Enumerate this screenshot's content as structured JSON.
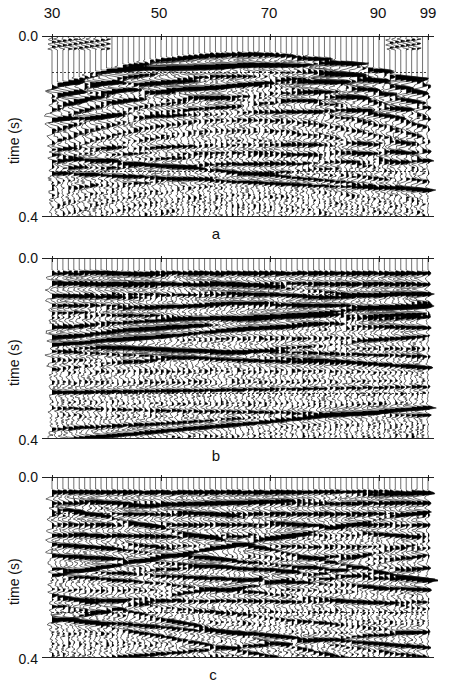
{
  "chart_data": [
    {
      "type": "seismic-wiggle",
      "title": "a",
      "xlabel": "trace number",
      "ylabel": "time (s)",
      "xticks": [
        30,
        50,
        70,
        90,
        99
      ],
      "yticks": [
        "0.0",
        "0.4"
      ],
      "xlim": [
        30,
        99
      ],
      "ylim": [
        0.0,
        0.4
      ],
      "description": "Raw shot gather with hyperbolic first-arrival reaching minimum (~0.04 s) near trace 65, deepening to ~0.1 s at edges; weak early noise at traces 30-40 and 92-97",
      "dashed_lines_at_s": [
        0.08,
        0.3
      ]
    },
    {
      "type": "seismic-wiggle",
      "title": "b",
      "xlabel": "trace number",
      "ylabel": "time (s)",
      "yticks": [
        "0.0",
        "0.4"
      ],
      "xlim": [
        30,
        99
      ],
      "ylim": [
        0.0,
        0.4
      ],
      "description": "Gather after flattening/static correction; first arrival flat near 0.03 s across all traces",
      "dashed_lines_at_s": [
        0.08,
        0.3
      ]
    },
    {
      "type": "seismic-wiggle",
      "title": "c",
      "xlabel": "trace number",
      "ylabel": "time (s)",
      "yticks": [
        "0.0",
        "0.4"
      ],
      "xlim": [
        30,
        99
      ],
      "ylim": [
        0.0,
        0.4
      ],
      "description": "Processed gather; flat first arrival near 0.03 s with dipping reflection events below 0.3 s",
      "dashed_lines_at_s": [
        0.08,
        0.3
      ]
    }
  ],
  "axis": {
    "xticks": [
      "30",
      "50",
      "70",
      "90",
      "99"
    ],
    "ylabel": "time (s)",
    "ytop": "0.0",
    "ybottom": "0.4"
  },
  "panels": [
    {
      "caption": "a"
    },
    {
      "caption": "b"
    },
    {
      "caption": "c"
    }
  ]
}
